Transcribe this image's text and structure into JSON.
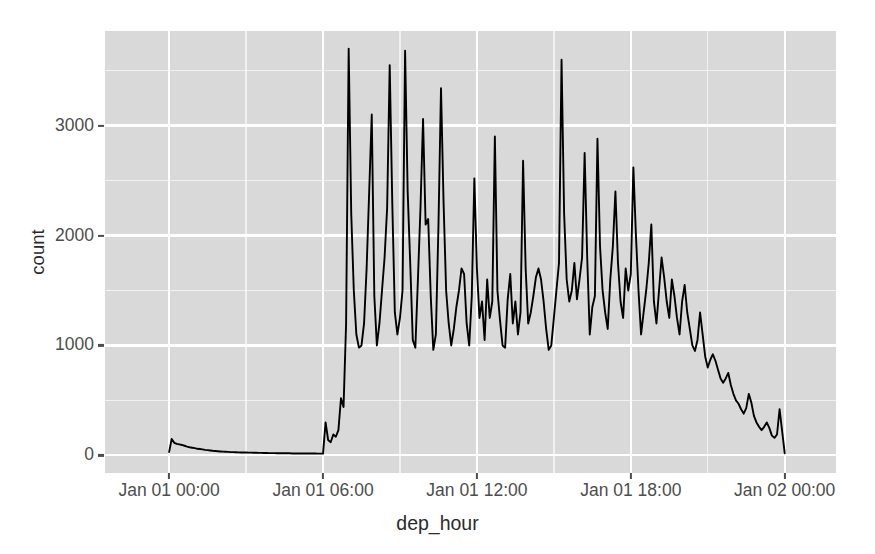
{
  "figure": {
    "type": "line-chart",
    "width": 875,
    "height": 554,
    "theme": "ggplot2-grey",
    "panel_background": "#d9d9d9",
    "grid_color": "#ffffff",
    "line_color": "#000000",
    "axis_text_color": "#4d4d4d",
    "axis_title_color": "#2b2b2b"
  },
  "axes": {
    "x": {
      "title": "dep_hour",
      "tick_labels": [
        "Jan 01 00:00",
        "Jan 01 06:00",
        "Jan 01 12:00",
        "Jan 01 18:00",
        "Jan 02 00:00"
      ],
      "tick_values": [
        0,
        6,
        12,
        18,
        24
      ],
      "range": [
        -2.5,
        26.0
      ],
      "unit": "hour"
    },
    "y": {
      "title": "count",
      "tick_labels": [
        "0",
        "1000",
        "2000",
        "3000"
      ],
      "tick_values": [
        0,
        1000,
        2000,
        3000
      ],
      "range": [
        -160,
        3860
      ]
    }
  },
  "chart_data": {
    "type": "line",
    "title": "",
    "subtitle": "",
    "xlabel": "dep_hour",
    "ylabel": "count",
    "xlim": [
      -2.5,
      26.0
    ],
    "ylim": [
      -160,
      3860
    ],
    "grid": true,
    "legend": "none",
    "series": [
      {
        "name": "count",
        "x": [
          0.0,
          0.1,
          0.2,
          0.3,
          0.4,
          0.5,
          0.6,
          0.7,
          0.8,
          0.9,
          1.0,
          1.1,
          1.2,
          1.3,
          1.4,
          1.5,
          1.6,
          1.7,
          1.8,
          1.9,
          2.0,
          2.1,
          2.2,
          2.3,
          2.4,
          2.5,
          2.6,
          2.7,
          2.8,
          2.9,
          3.0,
          3.1,
          3.2,
          3.3,
          3.4,
          3.5,
          3.6,
          3.7,
          3.8,
          3.9,
          4.0,
          4.1,
          4.2,
          4.3,
          4.4,
          4.5,
          4.6,
          4.7,
          4.8,
          4.9,
          5.0,
          5.1,
          5.2,
          5.3,
          5.4,
          5.5,
          5.6,
          5.7,
          5.8,
          5.9,
          6.0,
          6.1,
          6.2,
          6.3,
          6.4,
          6.5,
          6.6,
          6.7,
          6.8,
          6.9,
          7.0,
          7.1,
          7.2,
          7.3,
          7.4,
          7.5,
          7.6,
          7.7,
          7.8,
          7.9,
          8.0,
          8.1,
          8.2,
          8.3,
          8.4,
          8.5,
          8.6,
          8.7,
          8.8,
          8.9,
          9.0,
          9.1,
          9.2,
          9.3,
          9.4,
          9.5,
          9.6,
          9.7,
          9.8,
          9.9,
          10.0,
          10.1,
          10.2,
          10.3,
          10.4,
          10.5,
          10.6,
          10.7,
          10.8,
          10.9,
          11.0,
          11.1,
          11.2,
          11.3,
          11.4,
          11.5,
          11.6,
          11.7,
          11.8,
          11.9,
          12.0,
          12.1,
          12.2,
          12.3,
          12.4,
          12.5,
          12.6,
          12.7,
          12.8,
          12.9,
          13.0,
          13.1,
          13.2,
          13.3,
          13.4,
          13.5,
          13.6,
          13.7,
          13.8,
          13.9,
          14.0,
          14.1,
          14.2,
          14.3,
          14.4,
          14.5,
          14.6,
          14.7,
          14.8,
          14.9,
          15.0,
          15.1,
          15.2,
          15.3,
          15.4,
          15.5,
          15.6,
          15.7,
          15.8,
          15.9,
          16.0,
          16.1,
          16.2,
          16.3,
          16.4,
          16.5,
          16.6,
          16.7,
          16.8,
          16.9,
          17.0,
          17.1,
          17.2,
          17.3,
          17.4,
          17.5,
          17.6,
          17.7,
          17.8,
          17.9,
          18.0,
          18.1,
          18.2,
          18.3,
          18.4,
          18.5,
          18.6,
          18.7,
          18.8,
          18.9,
          19.0,
          19.1,
          19.2,
          19.3,
          19.4,
          19.5,
          19.6,
          19.7,
          19.8,
          19.9,
          20.0,
          20.1,
          20.2,
          20.3,
          20.4,
          20.5,
          20.6,
          20.7,
          20.8,
          20.9,
          21.0,
          21.1,
          21.2,
          21.3,
          21.4,
          21.5,
          21.6,
          21.7,
          21.8,
          21.9,
          22.0,
          22.1,
          22.2,
          22.3,
          22.4,
          22.5,
          22.6,
          22.7,
          22.8,
          22.9,
          23.0,
          23.1,
          23.2,
          23.3,
          23.4,
          23.5,
          23.6,
          23.7,
          23.8,
          24.0
        ],
        "values": [
          30,
          150,
          115,
          105,
          100,
          95,
          88,
          80,
          74,
          70,
          66,
          60,
          58,
          55,
          50,
          48,
          45,
          42,
          40,
          38,
          36,
          34,
          33,
          32,
          30,
          30,
          29,
          28,
          27,
          26,
          26,
          25,
          25,
          24,
          24,
          23,
          23,
          22,
          22,
          21,
          21,
          21,
          20,
          20,
          20,
          19,
          19,
          19,
          18,
          18,
          18,
          18,
          18,
          17,
          17,
          17,
          17,
          17,
          16,
          16,
          16,
          300,
          140,
          120,
          190,
          170,
          230,
          520,
          440,
          1200,
          3700,
          2200,
          1500,
          1100,
          980,
          1000,
          1200,
          1700,
          2400,
          3100,
          1450,
          1000,
          1200,
          1500,
          1800,
          2250,
          3550,
          2300,
          1300,
          1100,
          1250,
          1500,
          3680,
          2400,
          1750,
          1050,
          980,
          1600,
          2250,
          3060,
          2100,
          2150,
          1450,
          960,
          1100,
          2080,
          3340,
          2300,
          1500,
          1200,
          1000,
          1150,
          1350,
          1500,
          1700,
          1650,
          1200,
          1000,
          1450,
          2520,
          1700,
          1250,
          1400,
          1050,
          1600,
          1250,
          1400,
          2900,
          1500,
          1230,
          1000,
          980,
          1420,
          1650,
          1200,
          1400,
          1100,
          1300,
          2680,
          1700,
          1200,
          1300,
          1450,
          1620,
          1700,
          1600,
          1400,
          1150,
          960,
          1000,
          1250,
          1500,
          1750,
          3600,
          2200,
          1600,
          1400,
          1500,
          1750,
          1420,
          1600,
          1800,
          2750,
          1800,
          1100,
          1350,
          1450,
          2880,
          1900,
          1500,
          1300,
          1150,
          1600,
          1900,
          2400,
          1750,
          1400,
          1250,
          1700,
          1500,
          1650,
          2620,
          2000,
          1500,
          1100,
          1300,
          1500,
          1750,
          2100,
          1400,
          1200,
          1500,
          1800,
          1620,
          1400,
          1250,
          1600,
          1450,
          1250,
          1100,
          1400,
          1550,
          1300,
          1150,
          1000,
          950,
          1050,
          1300,
          1100,
          900,
          800,
          870,
          920,
          860,
          780,
          700,
          660,
          700,
          750,
          640,
          560,
          500,
          470,
          420,
          380,
          430,
          560,
          480,
          360,
          300,
          260,
          230,
          260,
          300,
          250,
          180,
          160,
          190,
          420,
          20
        ],
        "marker": "none",
        "line_width": 1.9
      }
    ]
  },
  "geometry": {
    "panel": {
      "left": 105,
      "top": 31,
      "width": 731,
      "height": 442
    },
    "x_pixels": {
      "0": 145,
      "6": 307.5,
      "12": 470,
      "18": 632.5,
      "24": 795
    },
    "y_pixels": {
      "0": 455,
      "1000": 345,
      "2000": 235,
      "3000": 125
    }
  }
}
